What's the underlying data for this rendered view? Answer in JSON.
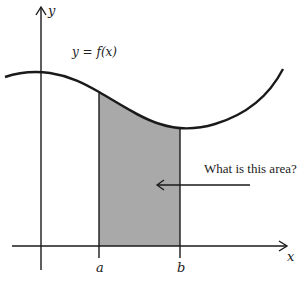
{
  "diagram": {
    "function_label": "y = f(x)",
    "x_axis_label": "x",
    "y_axis_label": "y",
    "lower_bound_label": "a",
    "upper_bound_label": "b",
    "question": "What is this area?",
    "colors": {
      "shade": "#a9a9a9",
      "stroke": "#1a1a1a"
    }
  }
}
